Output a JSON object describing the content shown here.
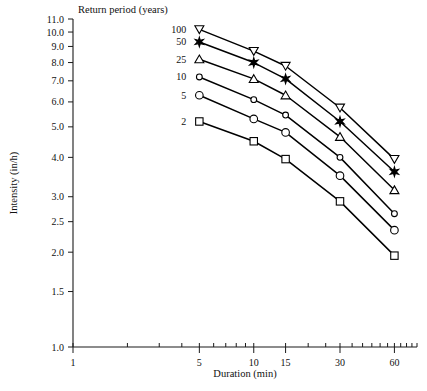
{
  "chart_data": {
    "type": "line",
    "title": "",
    "xlabel": "Duration (min)",
    "ylabel": "Intensity (in/h)",
    "xscale": "log",
    "yscale": "log",
    "xlim": [
      1,
      80
    ],
    "ylim": [
      1.0,
      11.0
    ],
    "grid": false,
    "legend_title": "Return period (years)",
    "legend_position": "upper-left-inside",
    "xtick_labels": [
      "1",
      "5",
      "10",
      "15",
      "30",
      "60"
    ],
    "xtick_values": [
      1,
      5,
      10,
      15,
      30,
      60
    ],
    "ytick_labels": [
      "1.0",
      "1.5",
      "2.0",
      "2.5",
      "3.0",
      "4.0",
      "5.0",
      "6.0",
      "7.0",
      "8.0",
      "9.0",
      "10.0",
      "11.0"
    ],
    "ytick_values": [
      1.0,
      1.5,
      2.0,
      2.5,
      3.0,
      4.0,
      5.0,
      6.0,
      7.0,
      8.0,
      9.0,
      10.0,
      11.0
    ],
    "x": [
      5,
      10,
      15,
      30,
      60
    ],
    "series": [
      {
        "name": "100",
        "marker": "triangle-down-open",
        "values": [
          10.2,
          8.7,
          7.8,
          5.75,
          3.95
        ]
      },
      {
        "name": "50",
        "marker": "star-solid",
        "values": [
          9.3,
          8.0,
          7.1,
          5.2,
          3.6
        ]
      },
      {
        "name": "25",
        "marker": "triangle-up-open",
        "values": [
          8.2,
          7.1,
          6.3,
          4.65,
          3.15
        ]
      },
      {
        "name": "10",
        "marker": "circle-small-open",
        "values": [
          7.2,
          6.1,
          5.45,
          4.0,
          2.65
        ]
      },
      {
        "name": "5",
        "marker": "circle-open",
        "values": [
          6.3,
          5.3,
          4.8,
          3.5,
          2.35
        ]
      },
      {
        "name": "2",
        "marker": "square-open",
        "values": [
          5.2,
          4.5,
          3.95,
          2.9,
          1.95
        ]
      }
    ],
    "legend_entries": [
      {
        "label": "100",
        "marker": "triangle-down-open"
      },
      {
        "label": "50",
        "marker": "star-solid"
      },
      {
        "label": "25",
        "marker": "triangle-up-open"
      },
      {
        "label": "10",
        "marker": "circle-small-open"
      },
      {
        "label": "5",
        "marker": "circle-open"
      },
      {
        "label": "2",
        "marker": "square-open"
      }
    ],
    "colors": {
      "line": "#000000",
      "marker_fill": "#ffffff",
      "marker_stroke": "#000000",
      "axis": "#1a1a1a",
      "text": "#111111",
      "background": "#ffffff"
    },
    "x_minor_ticks": [
      2,
      3,
      4,
      6,
      7,
      8,
      9,
      20,
      25,
      35,
      40,
      45,
      50,
      55,
      65,
      70,
      75,
      80
    ],
    "y_minor_ticks": []
  }
}
